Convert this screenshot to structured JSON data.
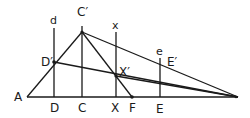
{
  "diagram": {
    "title": "",
    "colors": {
      "line": "#1a1a1a",
      "background": "#ffffff"
    },
    "points": {
      "A": {
        "label": "A",
        "x": 27,
        "y": 97
      },
      "D": {
        "label": "D",
        "x": 54,
        "y": 97
      },
      "C": {
        "label": "C",
        "x": 82,
        "y": 97
      },
      "X": {
        "label": "X",
        "x": 116,
        "y": 97
      },
      "F": {
        "label": "F",
        "x": 132,
        "y": 97
      },
      "E": {
        "label": "E",
        "x": 160,
        "y": 97
      },
      "Z": {
        "label": "",
        "x": 238,
        "y": 97
      },
      "Dp": {
        "label": "D′",
        "x": 54,
        "y": 62
      },
      "Cp": {
        "label": "C′",
        "x": 82,
        "y": 32
      },
      "Xp": {
        "label": "X′",
        "x": 116,
        "y": 76
      },
      "Ep": {
        "label": "E′",
        "x": 160,
        "y": 64
      }
    },
    "vertical_labels": {
      "d": "d",
      "x": "x",
      "e": "e"
    },
    "labels": {
      "A": "A",
      "D": "D",
      "C": "C",
      "X": "X",
      "F": "F",
      "E": "E",
      "Dp": "D′",
      "Cp": "C′",
      "Xp": "X′",
      "Ep": "E′"
    }
  }
}
